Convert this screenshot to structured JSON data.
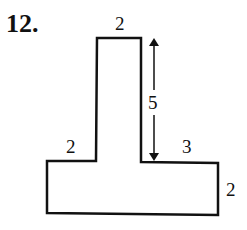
{
  "problem": {
    "number_label": "12."
  },
  "figure": {
    "shape": "inverted-T polygon",
    "stroke_color": "#111111",
    "fill_color": "#ffffff",
    "labels": {
      "stem_top_width": "2",
      "stem_height": "5",
      "left_ledge": "2",
      "right_ledge": "3",
      "base_height": "2"
    }
  }
}
